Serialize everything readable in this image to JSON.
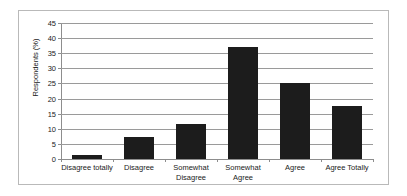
{
  "chart_data": {
    "type": "bar",
    "title": "",
    "xlabel": "",
    "ylabel": "Respondents (%)",
    "categories": [
      "Disagree totally",
      "Disagree",
      "Somewhat Disagree",
      "Somewhat Agree",
      "Agree",
      "Agree Totally"
    ],
    "category_lines": [
      [
        "Disagree totally"
      ],
      [
        "Disagree"
      ],
      [
        "Somewhat",
        "Disagree"
      ],
      [
        "Somewhat",
        "Agree"
      ],
      [
        "Agree"
      ],
      [
        "Agree Totally"
      ]
    ],
    "values": [
      1.4,
      7.4,
      11.6,
      37.2,
      25.0,
      17.6
    ],
    "ylim": [
      0,
      45
    ],
    "ytick_step": 5,
    "ytick_labels": [
      "0",
      "5",
      "10",
      "15",
      "20",
      "25",
      "30",
      "35",
      "40",
      "45"
    ],
    "grid": true,
    "legend": false,
    "bar_color": "#1c1c1c",
    "gridline_color": "#9a9a9a",
    "axis_color": "#8d8d8d",
    "border_color": "#b9b9b9",
    "background_color": "#ffffff"
  }
}
